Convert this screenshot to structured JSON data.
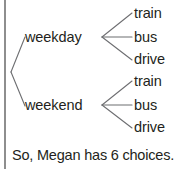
{
  "figure": {
    "type": "tree-diagram",
    "border_color": "#8e8e8e",
    "line_color": "#6d6e71",
    "text_color": "#231f20"
  },
  "tree": {
    "branches": [
      {
        "label": "weekday",
        "leaves": [
          "train",
          "bus",
          "drive"
        ]
      },
      {
        "label": "weekend",
        "leaves": [
          "train",
          "bus",
          "drive"
        ]
      }
    ]
  },
  "labels": {
    "weekday": "weekday",
    "weekend": "weekend",
    "a_train": "train",
    "a_bus": "bus",
    "a_drive": "drive",
    "b_train": "train",
    "b_bus": "bus",
    "b_drive": "drive"
  },
  "conclusion": {
    "text": "So, Megan has 6 choices."
  }
}
